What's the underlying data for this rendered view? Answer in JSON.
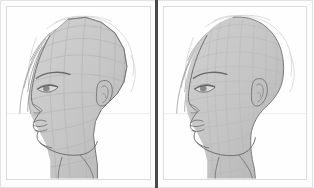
{
  "app": {
    "title": "Head Mesh Comparison",
    "view": "side-by-side",
    "background_color": "#fefefe",
    "frame_color": "#e3e3e3",
    "divider_color": "#4a4a4a"
  },
  "panels": [
    {
      "id": "left",
      "name": "low-poly-mesh-viewport",
      "label": "",
      "mesh_style": "faceted",
      "mesh_fill": "#c9c9c9",
      "mesh_stroke": "#a8a8a8",
      "outline_color": "#6b6b6b",
      "sketch_color": "#8a8a8a",
      "subject": "female head profile, facing left",
      "features": [
        "hair-strands",
        "eyebrow",
        "eye",
        "nose",
        "lips",
        "chin",
        "jaw",
        "ear",
        "neck"
      ],
      "guide_line_y": 118,
      "guide_color": "#e8e8e8"
    },
    {
      "id": "right",
      "name": "smooth-mesh-viewport",
      "label": "",
      "mesh_style": "subdivided",
      "mesh_fill": "#c6c6c6",
      "mesh_stroke": "#b0b0b0",
      "outline_color": "#707070",
      "sketch_color": "#8a8a8a",
      "subject": "female head profile, facing left",
      "features": [
        "hair-strands",
        "eyebrow",
        "eye",
        "nose",
        "lips",
        "chin",
        "jaw",
        "ear",
        "neck"
      ],
      "guide_line_y": 118,
      "guide_color": "#e8e8e8"
    }
  ]
}
